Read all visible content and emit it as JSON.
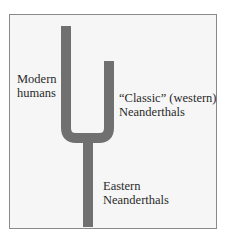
{
  "diagram": {
    "type": "phylogenetic-tree",
    "bar_color": "#707070",
    "background": "#f6f6f6",
    "border_color": "#8a8a8a",
    "branches": [
      {
        "id": "modern-humans",
        "label_lines": [
          "Modern",
          "humans"
        ]
      },
      {
        "id": "classic-neanderthals",
        "label_lines": [
          "“Classic” (western)",
          "Neanderthals"
        ]
      },
      {
        "id": "eastern-neanderthals",
        "label_lines": [
          "Eastern",
          "Neanderthals"
        ]
      }
    ]
  }
}
